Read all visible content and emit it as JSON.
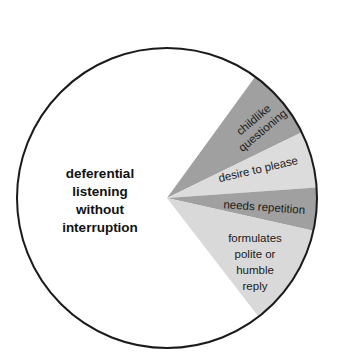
{
  "chart_data": {
    "type": "pie",
    "title": "",
    "center": [
      167,
      198
    ],
    "radius": 150,
    "slices": [
      {
        "label": "deferential listening without interruption",
        "lines": [
          "deferential",
          "listening",
          "without",
          "interruption"
        ],
        "start_deg": 52.4,
        "end_deg": 306,
        "percent": 70.4,
        "color": "#ffffff"
      },
      {
        "label": "childlike questioning",
        "lines": [
          "childlike",
          "questioning"
        ],
        "start_deg": -54,
        "end_deg": -26,
        "percent": 7.8,
        "color": "#a0a0a0"
      },
      {
        "label": "desire to please",
        "lines": [
          "desire to please"
        ],
        "start_deg": -26,
        "end_deg": -4,
        "percent": 6.1,
        "color": "#dcdcdc"
      },
      {
        "label": "needs repetition",
        "lines": [
          "needs repetition"
        ],
        "start_deg": -4,
        "end_deg": 12.6,
        "percent": 4.6,
        "color": "#a0a0a0"
      },
      {
        "label": "formulates polite or humble reply",
        "lines": [
          "formulates",
          "polite or",
          "humble",
          "reply"
        ],
        "start_deg": 12.6,
        "end_deg": 52.4,
        "percent": 11.1,
        "color": "#d9d9d9"
      }
    ],
    "legend": "none",
    "grid": false
  },
  "labels": {
    "deferential": [
      "deferential",
      "listening",
      "without",
      "interruption"
    ],
    "childlike": [
      "childlike",
      "questioning"
    ],
    "desire": "desire to please",
    "needs": "needs repetition",
    "formulates": [
      "formulates",
      "polite or",
      "humble",
      "reply"
    ]
  }
}
